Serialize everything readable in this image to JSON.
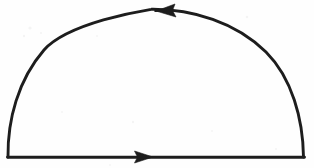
{
  "figure": {
    "title": "Semicircular contour",
    "description": "Hand-drawn closed semicircular contour with direction arrows",
    "medium": "ink on paper",
    "width_px": 314,
    "height_px": 168,
    "orientation": "counterclockwise",
    "background_color": "#fefefe",
    "ink_color": "#1d1d1d",
    "stroke_width_px": 2.8
  },
  "geometry": {
    "baseline": {
      "label": "real-axis segment",
      "start_x": 8,
      "start_y": 157,
      "end_x": 304,
      "end_y": 157,
      "direction": "left-to-right"
    },
    "arc": {
      "label": "upper semicircular arc",
      "start_x": 8,
      "start_y": 157,
      "end_x": 304,
      "end_y": 157,
      "apex_x": 172,
      "apex_y": 9,
      "radius_px": 148,
      "direction": "right-to-left"
    }
  },
  "arrows": [
    {
      "name": "arc-arrow",
      "on": "arc",
      "points": "left",
      "tip_x": 156,
      "tip_y": 11,
      "tail_x": 174,
      "tail_y": 10,
      "half_width_px": 6
    },
    {
      "name": "baseline-arrow",
      "on": "baseline",
      "points": "right",
      "tip_x": 153,
      "tip_y": 157,
      "tail_x": 135,
      "tail_y": 157,
      "half_width_px": 6
    }
  ],
  "chart_data": {
    "type": "line",
    "title": "Semicircular contour",
    "xlabel": "",
    "ylabel": "",
    "xlim": [
      0,
      314
    ],
    "ylim": [
      168,
      0
    ],
    "grid": false,
    "legend": "none",
    "series": [
      {
        "name": "baseline-segment",
        "x": [
          8,
          304
        ],
        "y": [
          157,
          157
        ]
      },
      {
        "name": "semicircular-arc",
        "x": [
          8,
          16,
          32,
          56,
          86,
          120,
          150,
          172,
          200,
          232,
          262,
          285,
          298,
          304
        ],
        "y": [
          157,
          124,
          90,
          60,
          36,
          19,
          11,
          9,
          13,
          28,
          55,
          92,
          128,
          157
        ]
      }
    ],
    "annotations": [
      {
        "text": "arrow pointing left on arc",
        "x": 156,
        "y": 11
      },
      {
        "text": "arrow pointing right on baseline",
        "x": 153,
        "y": 157
      }
    ]
  }
}
